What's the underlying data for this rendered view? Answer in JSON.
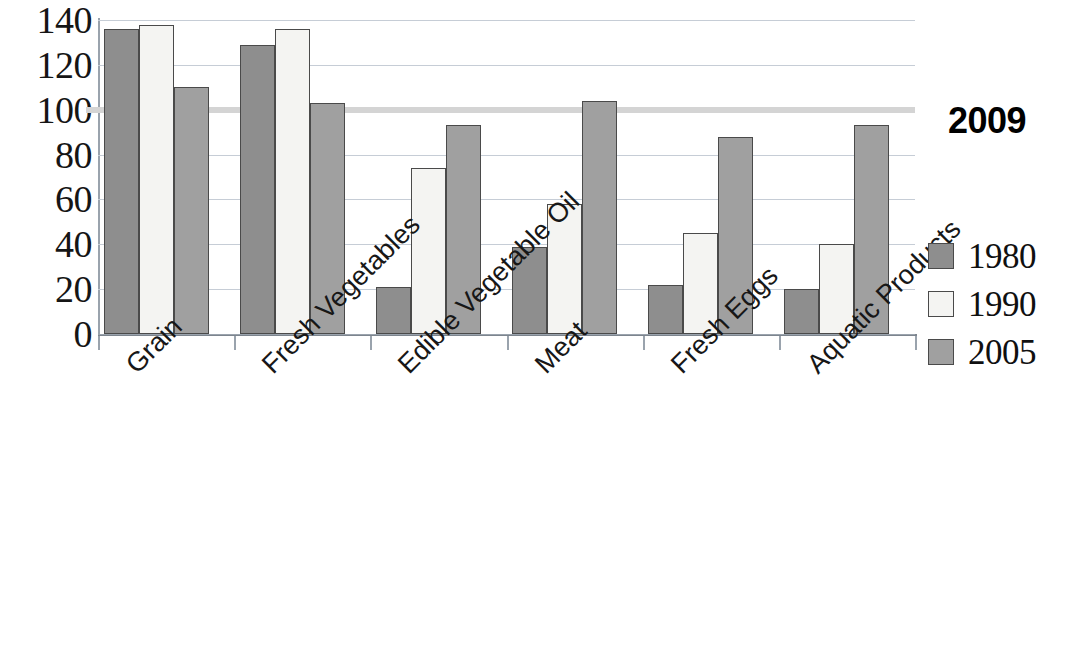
{
  "chart_data": {
    "type": "bar",
    "title": "",
    "subtitle": "",
    "xlabel": "",
    "ylabel": "",
    "ylim": [
      0,
      140
    ],
    "yticks": [
      0,
      20,
      40,
      60,
      80,
      100,
      120,
      140
    ],
    "ytick_labels": [
      "0",
      "20",
      "40",
      "60",
      "80",
      "100",
      "120",
      "140"
    ],
    "grid": true,
    "legend_position": "right",
    "categories": [
      "Grain",
      "Fresh Vegetables",
      "Edible Vegetable Oil",
      "Meat",
      "Fresh Eggs",
      "Aquatic Products"
    ],
    "series": [
      {
        "name": "1980",
        "color": "#8e8e8e",
        "values": [
          136,
          129,
          21,
          39,
          22,
          20
        ]
      },
      {
        "name": "1990",
        "color": "#f4f4f2",
        "values": [
          138,
          136,
          74,
          58,
          45,
          40
        ]
      },
      {
        "name": "2005",
        "color": "#a0a0a0",
        "values": [
          110,
          103,
          93,
          104,
          88,
          93
        ]
      }
    ],
    "annotations": [
      {
        "name": "reference-line-2009",
        "label": "2009",
        "value": 100,
        "color": "#d4d4d4"
      }
    ]
  },
  "legend": {
    "entries": [
      {
        "label": "1980"
      },
      {
        "label": "1990"
      },
      {
        "label": "2005"
      }
    ]
  },
  "annotation": {
    "reference_label": "2009"
  }
}
